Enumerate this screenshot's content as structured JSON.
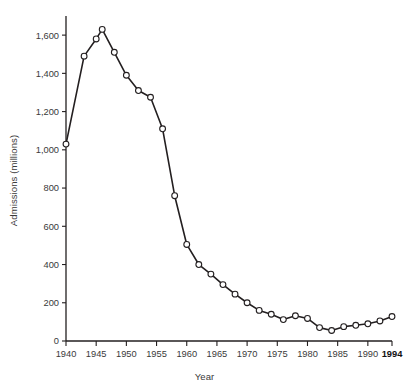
{
  "chart_data": {
    "type": "line",
    "title": "",
    "xlabel": "Year",
    "ylabel": "Admissions (millions)",
    "xlim": [
      1940,
      1994
    ],
    "ylim": [
      0,
      1700
    ],
    "grid": false,
    "legend": null,
    "y_ticks": [
      0,
      200,
      400,
      600,
      800,
      1000,
      1200,
      1400,
      1600
    ],
    "y_tick_labels": [
      "0",
      "200",
      "400",
      "600",
      "800",
      "1,000",
      "1,200",
      "1,400",
      "1,600"
    ],
    "x_ticks": [
      1940,
      1945,
      1950,
      1955,
      1960,
      1965,
      1970,
      1975,
      1980,
      1985,
      1990,
      1994
    ],
    "x_tick_labels": [
      "1940",
      "1945",
      "1950",
      "1955",
      "1960",
      "1965",
      "1970",
      "1975",
      "1980",
      "1985",
      "1990",
      "1994"
    ],
    "marker": "open-circle",
    "series": [
      {
        "name": "Admissions",
        "x": [
          1940,
          1943,
          1945,
          1946,
          1948,
          1950,
          1952,
          1954,
          1956,
          1958,
          1960,
          1962,
          1964,
          1966,
          1968,
          1970,
          1972,
          1974,
          1976,
          1978,
          1980,
          1982,
          1984,
          1986,
          1988,
          1990,
          1992,
          1994
        ],
        "values": [
          1030,
          1490,
          1580,
          1630,
          1510,
          1390,
          1310,
          1275,
          1110,
          760,
          505,
          400,
          350,
          295,
          245,
          200,
          160,
          140,
          112,
          132,
          118,
          70,
          55,
          75,
          82,
          90,
          105,
          128
        ]
      }
    ]
  }
}
